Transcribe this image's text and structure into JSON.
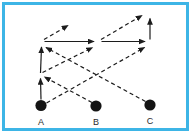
{
  "figure": {
    "type": "arrow-flow-diagram",
    "background": "#ffffff",
    "frame": {
      "border_color": "#3db5e6",
      "border_width": 3,
      "x": 3.5,
      "y": 3.5,
      "width": 184,
      "height": 126
    },
    "line": {
      "color": "#1c1c1c",
      "width": 1.2,
      "dash_pattern": "4 3"
    },
    "node_style": {
      "radius": 5.6,
      "fill": "#141414",
      "label_color": "#2b2b2b",
      "label_offset_y": 19
    },
    "nodes": [
      {
        "id": "A",
        "label": "A",
        "x": 41,
        "y": 105.5
      },
      {
        "id": "B",
        "label": "B",
        "x": 96,
        "y": 106
      },
      {
        "id": "C",
        "label": "C",
        "x": 150,
        "y": 105
      }
    ],
    "junctions": [
      {
        "id": "j1-mid-left",
        "x": 40.5,
        "y": 76
      },
      {
        "id": "j2-top-left",
        "x": 42,
        "y": 41.5
      },
      {
        "id": "j3-middle",
        "x": 98,
        "y": 41.5
      },
      {
        "id": "j4-right",
        "x": 150,
        "y": 41.5
      }
    ],
    "edges": [
      {
        "name": "edge-A-up-to-j1",
        "x1": 41,
        "y1": 99.5,
        "x2": 40.5,
        "y2": 78.5,
        "style": "solid"
      },
      {
        "name": "edge-j1-up-to-j2",
        "x1": 40.5,
        "y1": 73,
        "x2": 41.5,
        "y2": 47,
        "style": "solid"
      },
      {
        "name": "edge-B-diag-to-j1",
        "x1": 92,
        "y1": 102.5,
        "x2": 44.5,
        "y2": 77,
        "style": "dashed"
      },
      {
        "name": "edge-C-diag-to-j2",
        "x1": 145.5,
        "y1": 101.5,
        "x2": 46,
        "y2": 47.5,
        "style": "dashed"
      },
      {
        "name": "edge-j2-arrow-up-right",
        "x1": 44,
        "y1": 39.5,
        "x2": 68,
        "y2": 25.5,
        "style": "dashed"
      },
      {
        "name": "edge-j2-horiz-to-j3",
        "x1": 44.5,
        "y1": 41.5,
        "x2": 94,
        "y2": 41.5,
        "style": "solid"
      },
      {
        "name": "edge-j1-diag-to-j3",
        "x1": 42.5,
        "y1": 72.5,
        "x2": 92.5,
        "y2": 47.5,
        "style": "dashed"
      },
      {
        "name": "edge-j3-arrow-up-right",
        "x1": 101,
        "y1": 39.5,
        "x2": 142,
        "y2": 15.5,
        "style": "dashed"
      },
      {
        "name": "edge-j3-horiz-to-j4",
        "x1": 101.5,
        "y1": 41.5,
        "x2": 145,
        "y2": 41.5,
        "style": "solid"
      },
      {
        "name": "edge-A-diag-to-j4",
        "x1": 46.5,
        "y1": 103,
        "x2": 144.5,
        "y2": 47.5,
        "style": "dashed"
      },
      {
        "name": "edge-j4-arrow-up",
        "x1": 150,
        "y1": 39.5,
        "x2": 150,
        "y2": 18.5,
        "style": "solid"
      }
    ]
  }
}
